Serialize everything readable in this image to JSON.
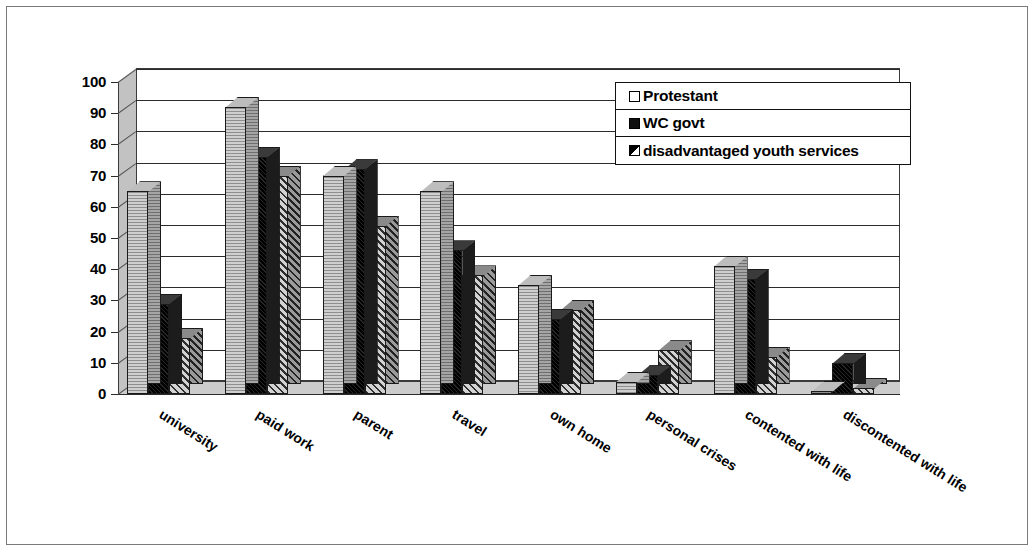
{
  "chart_data": {
    "type": "bar",
    "title": "",
    "subtitle": "",
    "xlabel": "",
    "ylabel": "",
    "ylim": [
      0,
      100
    ],
    "ytick_step": 10,
    "yticks": [
      0,
      10,
      20,
      30,
      40,
      50,
      60,
      70,
      80,
      90,
      100
    ],
    "grid": true,
    "legend_position": "top-right",
    "style": "3d-clustered-column",
    "categories": [
      "university",
      "paid work",
      "parent",
      "travel",
      "own home",
      "personal crises",
      "contented with life",
      "discontented with life"
    ],
    "series": [
      {
        "name": "Protestant",
        "pattern": "horizontal-lines",
        "color": "#b8b8b8",
        "values": [
          65,
          92,
          70,
          65,
          35,
          4,
          41,
          1
        ]
      },
      {
        "name": "WC govt",
        "pattern": "solid-black",
        "color": "#101010",
        "values": [
          29,
          76,
          72,
          46,
          24,
          6,
          37,
          10
        ]
      },
      {
        "name": "disadvantaged youth services",
        "pattern": "diagonal-hatch",
        "color": "#9c9c9c",
        "values": [
          18,
          70,
          54,
          38,
          27,
          14,
          12,
          2
        ]
      }
    ]
  },
  "legend": {
    "items": [
      {
        "label": "Protestant",
        "swatch": "legend-swatch-protestant"
      },
      {
        "label": "WC govt",
        "swatch": "legend-swatch-wc-govt"
      },
      {
        "label": "disadvantaged youth services",
        "swatch": "legend-swatch-disadvantaged-youth-services"
      }
    ]
  }
}
